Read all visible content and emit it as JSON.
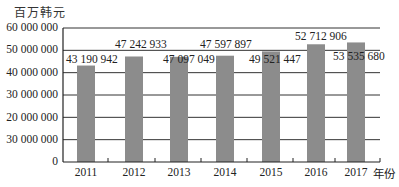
{
  "chart_data": {
    "type": "bar",
    "title": "",
    "ylabel": "百万韩元",
    "xlabel": "年份",
    "categories": [
      "2011",
      "2012",
      "2013",
      "2014",
      "2015",
      "2016",
      "2017"
    ],
    "values": [
      43190942,
      47242933,
      47097049,
      47597897,
      49521447,
      52712906,
      53535680
    ],
    "data_labels": [
      "43 190 942",
      "47 242 933",
      "47 097 049",
      "47 597 897",
      "49 521 447",
      "52 712 906",
      "53 535 680"
    ],
    "y_tick_labels": [
      "0",
      "30 000 000",
      "20 000 000",
      "30 000 000",
      "40 000 000",
      "50 000 000",
      "60 000 000"
    ],
    "y_tick_values": [
      0,
      10000000,
      20000000,
      30000000,
      40000000,
      50000000,
      60000000
    ],
    "ylim": [
      0,
      60000000
    ],
    "grid": true,
    "legend": "none",
    "bar_color": "#8c8c8c"
  },
  "labels": {
    "unit": "百万韩元",
    "x_unit": "年份"
  }
}
